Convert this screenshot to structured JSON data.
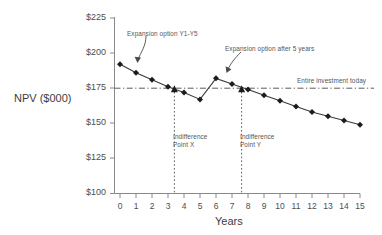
{
  "chart_data": {
    "type": "line",
    "title": "",
    "xlabel": "Years",
    "ylabel": "NPV ($000)",
    "xlim": [
      0,
      15
    ],
    "ylim": [
      100,
      225
    ],
    "grid": false,
    "legend": "none",
    "x_ticks": [
      "0",
      "1",
      "2",
      "3",
      "4",
      "5",
      "6",
      "7",
      "8",
      "9",
      "10",
      "11",
      "12",
      "13",
      "14",
      "15"
    ],
    "y_ticks": [
      "$100",
      "$125",
      "$150",
      "$175",
      "$200",
      "$225"
    ],
    "x": [
      0,
      1,
      2,
      3,
      4,
      5,
      6,
      7,
      8,
      9,
      10,
      11,
      12,
      13,
      14,
      15
    ],
    "series": [
      {
        "name": "NPV",
        "values": [
          192,
          186,
          181,
          176,
          172,
          167,
          182,
          178,
          174,
          170,
          166,
          162,
          158,
          155,
          152,
          149
        ]
      }
    ],
    "reference_line": {
      "label": "Entire investment today",
      "value": 175,
      "style": "dash-dot"
    },
    "markers": [
      {
        "label": "Indifference\nPoint X",
        "label_line1": "Indifference",
        "label_line2": "Point X",
        "x": 3.4,
        "y": 175
      },
      {
        "label": "Indifference\nPoint Y",
        "label_line1": "Indifference",
        "label_line2": "Point Y",
        "x": 7.6,
        "y": 175
      }
    ],
    "annotations": [
      {
        "text": "Expansion option Y1-Y5",
        "x": 1.0,
        "y": 205
      },
      {
        "text": "Expansion option after 5 years",
        "x": 6.0,
        "y": 196
      },
      {
        "text": "Entire investment today",
        "x": 12.6,
        "y": 180
      }
    ]
  },
  "axes": {
    "y_title": "NPV ($000)",
    "x_title": "Years",
    "y_ticks": [
      "$225",
      "$200",
      "$175",
      "$150",
      "$125",
      "$100"
    ],
    "x_ticks": [
      "0",
      "1",
      "2",
      "3",
      "4",
      "5",
      "6",
      "7",
      "8",
      "9",
      "10",
      "11",
      "12",
      "13",
      "14",
      "15"
    ]
  },
  "labels": {
    "annot_expansion_y1y5": "Expansion option Y1-Y5",
    "annot_expansion_after5": "Expansion option after 5 years",
    "annot_entire_investment": "Entire investment today",
    "indiff_x_line1": "Indifference",
    "indiff_x_line2": "Point X",
    "indiff_y_line1": "Indifference",
    "indiff_y_line2": "Point Y"
  },
  "colors": {
    "axis": "#808080",
    "line": "#3a3a3a",
    "marker": "#1c1c1c",
    "text": "#4a4a4a",
    "background": "#ffffff"
  }
}
